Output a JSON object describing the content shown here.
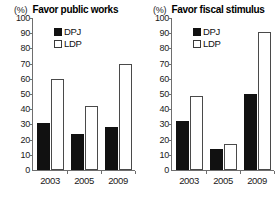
{
  "figure": {
    "width": 279,
    "height": 204,
    "background": "#ffffff"
  },
  "chart_data": [
    {
      "type": "bar",
      "title": "Favor public works",
      "unit_label": "(%)",
      "xlabel": "",
      "ylabel": "(%)",
      "categories": [
        "2003",
        "2005",
        "2009"
      ],
      "series": [
        {
          "name": "DPJ",
          "color": "#111111",
          "values": [
            31,
            24,
            28
          ]
        },
        {
          "name": "LDP",
          "color": "#ffffff",
          "values": [
            60,
            42,
            70
          ]
        }
      ],
      "ylim": [
        0,
        100
      ],
      "yticks": [
        0,
        10,
        20,
        30,
        40,
        50,
        60,
        70,
        80,
        90,
        100
      ],
      "grid": false,
      "legend_position": "top-center"
    },
    {
      "type": "bar",
      "title": "Favor fiscal stimulus",
      "unit_label": "(%)",
      "xlabel": "",
      "ylabel": "(%)",
      "categories": [
        "2003",
        "2005",
        "2009"
      ],
      "series": [
        {
          "name": "DPJ",
          "color": "#111111",
          "values": [
            32,
            14,
            50
          ]
        },
        {
          "name": "LDP",
          "color": "#ffffff",
          "values": [
            49,
            17,
            91
          ]
        }
      ],
      "ylim": [
        0,
        100
      ],
      "yticks": [
        0,
        10,
        20,
        30,
        40,
        50,
        60,
        70,
        80,
        90,
        100
      ],
      "grid": false,
      "legend_position": "top-center"
    }
  ]
}
